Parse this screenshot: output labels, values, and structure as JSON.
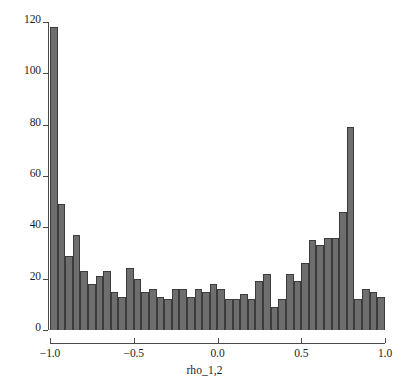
{
  "chart_data": {
    "type": "bar",
    "title": "",
    "subtitle": "",
    "xlabel": "rho_1,2",
    "ylabel": "",
    "xlim": [
      -1.0,
      1.0
    ],
    "ylim": [
      0,
      120
    ],
    "grid": false,
    "legend": null,
    "bin_count": 44,
    "bin_width": 0.0455,
    "categories": [
      "-1.00",
      "-0.95",
      "-0.91",
      "-0.86",
      "-0.82",
      "-0.77",
      "-0.73",
      "-0.68",
      "-0.64",
      "-0.59",
      "-0.55",
      "-0.50",
      "-0.45",
      "-0.41",
      "-0.36",
      "-0.32",
      "-0.27",
      "-0.23",
      "-0.18",
      "-0.14",
      "-0.09",
      "-0.05",
      "0.00",
      "0.05",
      "0.09",
      "0.14",
      "0.18",
      "0.23",
      "0.27",
      "0.32",
      "0.36",
      "0.41",
      "0.45",
      "0.50",
      "0.55",
      "0.59",
      "0.64",
      "0.68",
      "0.73",
      "0.77",
      "0.82",
      "0.86",
      "0.91",
      "0.95"
    ],
    "values": [
      118,
      49,
      29,
      37,
      23,
      18,
      21,
      23,
      15,
      13,
      24,
      20,
      15,
      16,
      13,
      12,
      16,
      16,
      13,
      16,
      15,
      18,
      16,
      12,
      12,
      14,
      12,
      19,
      22,
      9,
      12,
      22,
      19,
      26,
      35,
      33,
      36,
      36,
      46,
      79,
      12,
      16,
      15,
      13
    ],
    "series": [
      {
        "name": "frequency",
        "color": "#6e6e6e",
        "edge_color": "#3c3c3c",
        "values": [
          118,
          49,
          29,
          37,
          23,
          18,
          21,
          23,
          15,
          13,
          24,
          20,
          15,
          16,
          13,
          12,
          16,
          16,
          13,
          16,
          15,
          18,
          16,
          12,
          12,
          14,
          12,
          19,
          22,
          9,
          12,
          22,
          19,
          26,
          35,
          33,
          36,
          36,
          46,
          79,
          12,
          16,
          15,
          13
        ]
      }
    ],
    "y_ticks": [
      0,
      20,
      40,
      60,
      80,
      100,
      120
    ],
    "y_tick_labels": [
      "0",
      "20",
      "40",
      "60",
      "80",
      "100",
      "120"
    ],
    "x_ticks": [
      -1.0,
      -0.5,
      0.0,
      0.5,
      1.0
    ],
    "x_tick_labels": [
      "-1.0",
      "-0.5",
      "0.0",
      "0.5",
      "1.0"
    ],
    "max_value": 118,
    "min_value": 9,
    "annotations": []
  },
  "axes": {
    "x_title": "rho_1,2"
  },
  "caption": {
    "text": ""
  }
}
